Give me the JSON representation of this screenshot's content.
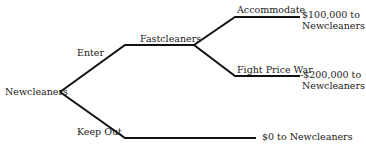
{
  "diagram": {
    "type": "game-tree",
    "root": {
      "player": "Newcleaners"
    },
    "branches": {
      "enter": {
        "label": "Enter",
        "next_player": "Fastcleaners",
        "branches": {
          "accommodate": {
            "label": "Accommodate",
            "payoff_line1": "$100,000 to",
            "payoff_line2": "Newcleaners"
          },
          "fight": {
            "label": "Fight Price War",
            "payoff_line1": "-$200,000 to",
            "payoff_line2": "Newcleaners"
          }
        }
      },
      "keep_out": {
        "label": "Keep Out",
        "payoff": "$0 to Newcleaners"
      }
    }
  }
}
